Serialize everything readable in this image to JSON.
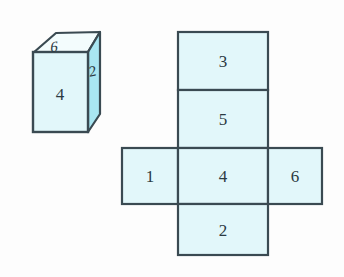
{
  "figure": {
    "background_color": "#fdfdfd",
    "stroke_color": "#3a4a52",
    "face_fill": "#e2f7fa",
    "side_fill": "#a9e6f2",
    "top_fill": "#f2fcfd",
    "label_color": "#2b3a42"
  },
  "solid": {
    "name": "rectangular-box",
    "faces": {
      "top": "6",
      "front": "4",
      "right": "2"
    }
  },
  "net": {
    "name": "cube-net-cross",
    "cells": [
      {
        "id": "cell-top",
        "label": "3",
        "x": 178,
        "y": 32,
        "w": 90,
        "h": 58
      },
      {
        "id": "cell-upper-middle",
        "label": "5",
        "x": 178,
        "y": 90,
        "w": 90,
        "h": 58
      },
      {
        "id": "cell-left",
        "label": "1",
        "x": 122,
        "y": 148,
        "w": 56,
        "h": 56
      },
      {
        "id": "cell-center",
        "label": "4",
        "x": 178,
        "y": 148,
        "w": 90,
        "h": 56
      },
      {
        "id": "cell-right",
        "label": "6",
        "x": 268,
        "y": 148,
        "w": 54,
        "h": 56
      },
      {
        "id": "cell-bottom",
        "label": "2",
        "x": 178,
        "y": 204,
        "w": 90,
        "h": 51
      }
    ]
  }
}
